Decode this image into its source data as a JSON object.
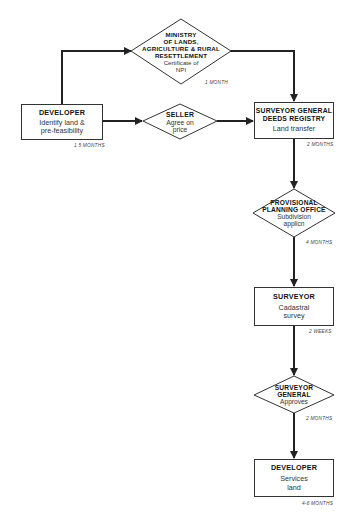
{
  "nodes": {
    "developer_start": {
      "title": "DEVELOPER",
      "line1": "Identify land &",
      "line2": "pre-feasibility",
      "duration": "1.5 MONTHS",
      "shape": "box"
    },
    "ministry": {
      "title1": "MINISTRY",
      "title2": "OF LANDS,",
      "title3": "AGRICULTURE & RURAL",
      "title4": "RESETTLEMENT",
      "line1": "Certificate of",
      "line2": "NPI",
      "duration": "1 MONTH",
      "shape": "diamond"
    },
    "seller": {
      "title": "SELLER",
      "line1": "Agree on",
      "line2": "price",
      "shape": "diamond"
    },
    "surveyor_general_deeds": {
      "title1": "SURVEYOR GENERAL",
      "title2": "DEEDS REGISTRY",
      "line1": "Land transfer",
      "duration": "2 MONTHS",
      "shape": "box"
    },
    "provisional_planning": {
      "title1": "PROVISIONAL",
      "title2": "PLANNING OFFICE",
      "line1": "Subdivision",
      "line2": "applicn",
      "duration": "4 MONTHS",
      "shape": "diamond"
    },
    "surveyor": {
      "title": "SURVEYOR",
      "line1": "Cadastral",
      "line2": "survey",
      "duration": "2 WEEKS",
      "shape": "box"
    },
    "surveyor_general_approves": {
      "title1": "SURVEYOR",
      "title2": "GENERAL",
      "line1": "Approves",
      "duration": "2 MONTHS",
      "shape": "diamond"
    },
    "developer_end": {
      "title": "DEVELOPER",
      "line1": "Services",
      "line2": "land",
      "duration": "4-6 MONTHS",
      "shape": "box"
    }
  },
  "edges": [
    {
      "from": "developer_start",
      "to": "ministry"
    },
    {
      "from": "developer_start",
      "to": "seller"
    },
    {
      "from": "ministry",
      "to": "surveyor_general_deeds"
    },
    {
      "from": "seller",
      "to": "surveyor_general_deeds"
    },
    {
      "from": "surveyor_general_deeds",
      "to": "provisional_planning"
    },
    {
      "from": "provisional_planning",
      "to": "surveyor"
    },
    {
      "from": "surveyor",
      "to": "surveyor_general_approves"
    },
    {
      "from": "surveyor_general_approves",
      "to": "developer_end"
    }
  ],
  "colors": {
    "line": "#222222",
    "stroke": "#333333",
    "background": "#ffffff"
  }
}
